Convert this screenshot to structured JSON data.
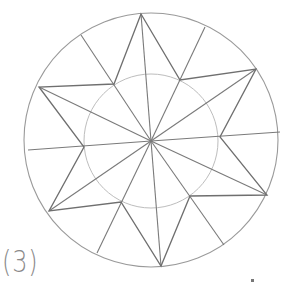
{
  "figure": {
    "label": "(3)",
    "colors": {
      "star": "#6f6f6f",
      "outer_circle": "#9a9a9a",
      "inner_circle": "#bdbdbd",
      "spoke": "#7a7a7a"
    },
    "center": [
      151,
      141
    ],
    "outer_radius": 127,
    "inner_radius": 67,
    "star_tips": [
      [
        141,
        14
      ],
      [
        256,
        69
      ],
      [
        267,
        195
      ],
      [
        161,
        266
      ],
      [
        49,
        211
      ],
      [
        39,
        87
      ]
    ],
    "inner_vertices": [
      [
        180,
        80
      ],
      [
        220,
        137
      ],
      [
        190,
        196
      ],
      [
        121,
        202
      ],
      [
        84,
        147
      ],
      [
        114,
        84
      ]
    ],
    "rim_spoke_ends": [
      [
        205,
        27
      ],
      [
        280,
        132
      ],
      [
        224,
        245
      ],
      [
        97,
        253
      ],
      [
        28,
        150
      ],
      [
        81,
        35
      ]
    ]
  }
}
